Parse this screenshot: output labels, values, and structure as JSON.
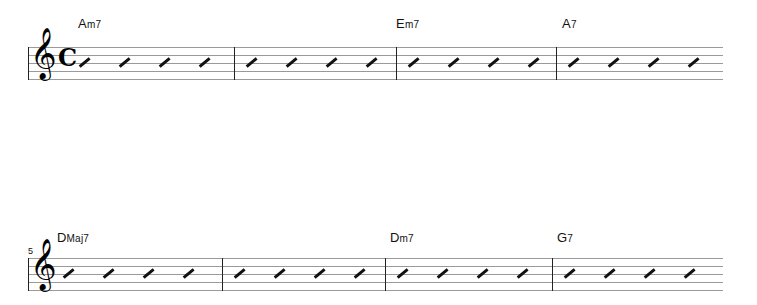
{
  "document": {
    "type": "lead-sheet",
    "clef": "treble",
    "clef_glyph": "𝄞",
    "time_signature": "common-time",
    "time_signature_glyph": "𝄴",
    "notation": "rhythm-slash",
    "beats_per_measure": 4,
    "total_measures": 12,
    "ending": "repeat-end"
  },
  "systems": [
    {
      "index": 0,
      "measure_number_label": "",
      "show_clef": true,
      "show_time_signature": true,
      "barlines_x": [
        234,
        396,
        556
      ],
      "measures": [
        {
          "number": 1,
          "slash_x": [
            78,
            118,
            158,
            198
          ]
        },
        {
          "number": 2,
          "slash_x": [
            245,
            285,
            325,
            365
          ]
        },
        {
          "number": 3,
          "slash_x": [
            407,
            447,
            487,
            527
          ]
        },
        {
          "number": 4,
          "slash_x": [
            567,
            607,
            647,
            687
          ]
        }
      ],
      "chords": [
        {
          "label": "Am7",
          "root": "A",
          "accidental": "",
          "quality": "m7",
          "superscript": "",
          "x": 78
        },
        {
          "label": "Em7",
          "root": "E",
          "accidental": "",
          "quality": "m7",
          "superscript": "",
          "x": 396
        },
        {
          "label": "A7",
          "root": "A",
          "accidental": "",
          "quality": "7",
          "superscript": "",
          "x": 562
        }
      ]
    },
    {
      "index": 1,
      "measure_number_label": "5",
      "show_clef": true,
      "show_time_signature": false,
      "barlines_x": [
        222,
        385,
        552
      ],
      "measures": [
        {
          "number": 5,
          "slash_x": [
            62,
            102,
            142,
            182
          ]
        },
        {
          "number": 6,
          "slash_x": [
            233,
            273,
            313,
            353
          ]
        },
        {
          "number": 7,
          "slash_x": [
            396,
            436,
            476,
            516
          ]
        },
        {
          "number": 8,
          "slash_x": [
            563,
            603,
            643,
            683
          ]
        }
      ],
      "chords": [
        {
          "label": "DMaj7",
          "root": "D",
          "accidental": "",
          "quality": "Maj7",
          "superscript": "",
          "x": 57
        },
        {
          "label": "Dm7",
          "root": "D",
          "accidental": "",
          "quality": "m7",
          "superscript": "",
          "x": 390
        },
        {
          "label": "G7",
          "root": "G",
          "accidental": "",
          "quality": "7",
          "superscript": "",
          "x": 557
        }
      ]
    },
    {
      "index": 2,
      "measure_number_label": "9",
      "show_clef": true,
      "show_time_signature": false,
      "barlines_x": [
        215,
        380,
        545
      ],
      "measures": [
        {
          "number": 9,
          "slash_x": [
            62,
            102,
            142,
            182
          ]
        },
        {
          "number": 10,
          "slash_x": [
            226,
            266,
            306,
            346
          ]
        },
        {
          "number": 11,
          "slash_x": [
            391,
            431,
            471,
            511
          ]
        },
        {
          "number": 12,
          "slash_x": [
            556,
            596,
            636,
            676
          ]
        }
      ],
      "chords": [
        {
          "label": "CMaj7",
          "root": "C",
          "accidental": "",
          "quality": "Maj7",
          "superscript": "",
          "x": 57
        },
        {
          "label": "Cm7",
          "root": "C",
          "accidental": "",
          "quality": "m7",
          "superscript": "",
          "x": 221
        },
        {
          "label": "F7",
          "root": "F",
          "accidental": "",
          "quality": "7",
          "superscript": "",
          "x": 297
        },
        {
          "label": "B♭Maj7",
          "root": "B",
          "accidental": "♭",
          "quality": "Maj7",
          "superscript": "",
          "x": 390
        },
        {
          "label": "Bm7(♭5)",
          "root": "B",
          "accidental": "",
          "quality": "m7",
          "superscript": "(♭5)",
          "x": 541
        },
        {
          "label": "E7alt.",
          "root": "E",
          "accidental": "",
          "quality": "7alt.",
          "superscript": "",
          "x": 629
        }
      ],
      "repeat_end_x": 711
    }
  ],
  "colors": {
    "staff_line": "#9a9a9a",
    "ink": "#111111",
    "background": "#ffffff"
  }
}
